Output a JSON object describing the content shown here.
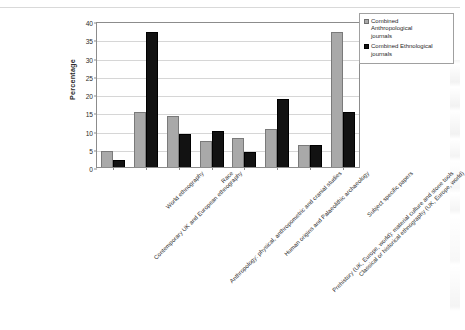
{
  "chart_data": {
    "type": "bar",
    "title": "",
    "xlabel": "",
    "ylabel": "Percentage",
    "ylim": [
      0,
      40
    ],
    "ytick_step": 5,
    "yticks": [
      "0",
      "5",
      "10",
      "15",
      "20",
      "25",
      "30",
      "35",
      "40"
    ],
    "grid": true,
    "legend_position": "right",
    "categories": [
      "Contemporary UK and European ethnography",
      "World ethnography",
      "Anthropology: physical, anthropometric and cranial studies",
      "Race",
      "Human origins and Palaeolithic archaeology",
      "Prehistory (UK, Europe, world): material culture and stone tools",
      "Classical or historical ethnography (UK, Europe, world)",
      "Subject specific papers"
    ],
    "series": [
      {
        "name": "Combined Anthropological journals",
        "color": "#a9a9a9",
        "values": [
          4.5,
          15,
          14,
          7,
          8,
          10.3,
          6,
          37
        ]
      },
      {
        "name": "Combined Ethnological journals",
        "color": "#121212",
        "values": [
          2,
          37,
          9,
          10,
          4,
          18.5,
          6,
          15
        ]
      }
    ]
  },
  "legend": {
    "items": [
      {
        "label_line1": "Combined",
        "label_line2": "Anthropological",
        "label_line3": "journals",
        "swatch": "a"
      },
      {
        "label_line1": "Combined Ethnological",
        "label_line2": "journals",
        "label_line3": "",
        "swatch": "b"
      }
    ]
  }
}
